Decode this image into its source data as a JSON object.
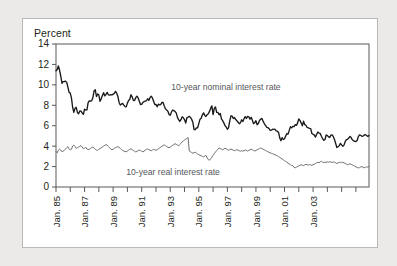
{
  "figure": {
    "background_color": "#eceae8",
    "card_color": "#ffffff",
    "border_color": "#b9b9b9"
  },
  "chart_data": {
    "type": "line",
    "title": "",
    "subtitle": "",
    "ylabel": "Percent",
    "xlabel": "",
    "ylim": [
      0,
      14
    ],
    "ytick_values": [
      0,
      2,
      4,
      6,
      8,
      10,
      12,
      14
    ],
    "ytick_labels": [
      "0",
      "2",
      "4",
      "6",
      "8",
      "10",
      "12",
      "14"
    ],
    "xlim": [
      "Jan. 85",
      "Jul. 03"
    ],
    "xtick_labels": [
      "Jan. 85",
      "Jan. 87",
      "Jan. 89",
      "Jan. 91",
      "Jan. 93",
      "Jan. 95",
      "Jan. 97",
      "Jan. 99",
      "Jan. 01",
      "Jan. 03"
    ],
    "xtick_minor_years": [
      "1986",
      "1988",
      "1990",
      "1992",
      "1994",
      "1996",
      "1998",
      "2000",
      "2002"
    ],
    "grid": false,
    "legend_position": "inline-annotation",
    "x_start_year": 1985,
    "x_end_year": 2003.5,
    "x_step_months": 1,
    "annotations": [
      {
        "text": "10-year nominal interest rate",
        "x_year": 1996.9,
        "y_value": 9.45,
        "color": "#55585c"
      },
      {
        "text": "10-year real interest rate",
        "x_year": 1993.2,
        "y_value": 1.15,
        "color": "#55585c"
      }
    ],
    "series": [
      {
        "name": "10-year nominal interest rate",
        "color": "#1a1a1a",
        "width": 1.35,
        "values": [
          11.38,
          11.51,
          11.86,
          11.43,
          10.85,
          10.16,
          10.31,
          10.33,
          10.37,
          10.24,
          9.78,
          9.26,
          9.19,
          8.7,
          7.78,
          7.3,
          7.71,
          7.8,
          7.3,
          7.17,
          7.45,
          7.43,
          7.25,
          7.11,
          7.61,
          7.54,
          7.55,
          8.25,
          8.43,
          8.4,
          8.45,
          8.76,
          9.42,
          9.52,
          8.86,
          9.11,
          9.0,
          8.39,
          8.63,
          8.95,
          9.23,
          8.92,
          9.06,
          9.26,
          9.03,
          8.99,
          9.04,
          9.01,
          9.09,
          9.17,
          9.36,
          9.18,
          8.86,
          8.28,
          8.02,
          8.11,
          8.19,
          8.01,
          7.87,
          7.84,
          8.21,
          8.47,
          8.59,
          9.03,
          8.83,
          8.48,
          8.47,
          8.75,
          8.89,
          8.72,
          8.39,
          8.08,
          8.09,
          8.28,
          8.37,
          8.4,
          8.46,
          8.64,
          8.47,
          8.75,
          8.89,
          8.72,
          8.39,
          8.08,
          8.09,
          7.85,
          8.11,
          8.04,
          8.07,
          8.28,
          8.27,
          7.9,
          7.65,
          7.53,
          7.42,
          7.09,
          7.03,
          7.34,
          7.54,
          7.48,
          7.39,
          7.26,
          6.84,
          6.59,
          6.42,
          6.59,
          6.87,
          6.77,
          6.6,
          6.26,
          6.8,
          6.85,
          6.92,
          6.81,
          6.63,
          6.32,
          5.62,
          5.61,
          5.78,
          5.8,
          6.21,
          6.64,
          6.74,
          7.07,
          7.26,
          7.01,
          6.91,
          7.08,
          7.17,
          7.4,
          7.72,
          7.94,
          7.09,
          7.69,
          7.83,
          7.31,
          7.31,
          7.07,
          7.2,
          6.66,
          6.5,
          6.28,
          6.01,
          5.87,
          5.65,
          5.81,
          6.48,
          6.97,
          6.94,
          6.71,
          6.8,
          6.6,
          6.48,
          6.34,
          6.2,
          6.3,
          6.58,
          6.42,
          6.69,
          6.89,
          6.71,
          6.91,
          6.87,
          6.64,
          6.83,
          6.53,
          6.2,
          6.3,
          6.49,
          6.1,
          6.22,
          6.51,
          6.65,
          6.71,
          6.45,
          6.21,
          6.03,
          5.85,
          5.82,
          5.71,
          5.54,
          5.57,
          5.65,
          5.64,
          5.65,
          5.5,
          5.46,
          5.34,
          4.81,
          4.53,
          4.83,
          4.65,
          4.72,
          5.0,
          5.23,
          5.18,
          5.54,
          5.9,
          5.79,
          5.94,
          5.92,
          6.11,
          6.03,
          6.28,
          6.66,
          6.52,
          6.26,
          5.99,
          6.44,
          6.1,
          6.05,
          5.83,
          5.8,
          5.74,
          5.72,
          5.24,
          5.16,
          5.1,
          4.89,
          5.14,
          5.39,
          5.28,
          5.24,
          4.97,
          4.73,
          4.57,
          4.65,
          5.09,
          5.04,
          4.91,
          4.85,
          5.08,
          5.1,
          4.93,
          4.65,
          4.26,
          3.87,
          3.94,
          4.05,
          4.27,
          4.12,
          3.98,
          4.1,
          4.45,
          4.63,
          4.67,
          4.79,
          4.95,
          4.84,
          4.62,
          4.52,
          4.48,
          4.45,
          4.56,
          4.92,
          5.1,
          5.06,
          4.96,
          4.98,
          5.09,
          5.12,
          5.04,
          4.95,
          5.05
        ]
      },
      {
        "name": "10-year real interest rate",
        "color": "#6d6e71",
        "width": 1.0,
        "values": [
          3.48,
          3.34,
          3.6,
          3.7,
          3.62,
          3.45,
          3.52,
          3.6,
          3.7,
          3.85,
          3.95,
          3.75,
          3.62,
          3.7,
          4.02,
          4.1,
          3.96,
          3.78,
          3.84,
          3.9,
          3.98,
          4.05,
          3.92,
          3.74,
          3.8,
          3.88,
          3.72,
          3.66,
          3.7,
          3.78,
          3.86,
          3.92,
          3.8,
          3.7,
          3.62,
          3.58,
          3.7,
          3.78,
          3.84,
          3.92,
          4.0,
          4.08,
          4.14,
          4.1,
          3.98,
          3.84,
          3.72,
          3.64,
          3.7,
          3.78,
          3.85,
          3.9,
          3.96,
          3.88,
          3.78,
          3.66,
          3.58,
          3.52,
          3.48,
          3.45,
          3.52,
          3.6,
          3.68,
          3.74,
          3.66,
          3.58,
          3.5,
          3.44,
          3.48,
          3.56,
          3.62,
          3.58,
          3.5,
          3.44,
          3.52,
          3.6,
          3.68,
          3.72,
          3.66,
          3.6,
          3.55,
          3.62,
          3.7,
          3.64,
          3.58,
          3.66,
          3.74,
          3.82,
          3.9,
          3.98,
          4.06,
          4.12,
          4.05,
          3.96,
          3.9,
          3.84,
          3.92,
          4.0,
          4.08,
          4.16,
          4.24,
          4.18,
          4.1,
          4.02,
          4.16,
          4.28,
          4.4,
          4.52,
          4.6,
          4.68,
          4.76,
          4.84,
          3.52,
          3.45,
          3.38,
          3.3,
          3.36,
          3.42,
          3.3,
          3.22,
          3.18,
          3.1,
          3.05,
          3.0,
          2.95,
          3.02,
          3.1,
          2.85,
          2.68,
          2.62,
          2.78,
          2.92,
          3.1,
          3.28,
          3.42,
          3.56,
          3.7,
          3.82,
          3.76,
          3.7,
          3.64,
          3.72,
          3.8,
          3.74,
          3.66,
          3.6,
          3.66,
          3.72,
          3.66,
          3.6,
          3.55,
          3.6,
          3.66,
          3.6,
          3.55,
          3.5,
          3.56,
          3.5,
          3.56,
          3.62,
          3.58,
          3.52,
          3.58,
          3.64,
          3.7,
          3.64,
          3.58,
          3.52,
          3.58,
          3.64,
          3.7,
          3.76,
          3.82,
          3.76,
          3.7,
          3.64,
          3.58,
          3.52,
          3.46,
          3.4,
          3.34,
          3.3,
          3.26,
          3.2,
          3.16,
          3.1,
          3.04,
          2.98,
          2.9,
          2.82,
          2.74,
          2.66,
          2.58,
          2.5,
          2.42,
          2.34,
          2.26,
          2.18,
          2.12,
          2.08,
          1.92,
          1.88,
          1.94,
          2.0,
          2.06,
          2.12,
          2.18,
          2.14,
          2.1,
          2.16,
          2.22,
          2.18,
          2.14,
          2.2,
          2.16,
          2.12,
          2.18,
          2.24,
          2.3,
          2.36,
          2.42,
          2.38,
          2.46,
          2.52,
          2.44,
          2.38,
          2.44,
          2.4,
          2.46,
          2.42,
          2.48,
          2.44,
          2.4,
          2.46,
          2.42,
          2.36,
          2.3,
          2.36,
          2.42,
          2.38,
          2.44,
          2.4,
          2.36,
          2.3,
          2.24,
          2.18,
          2.22,
          2.28,
          2.22,
          2.16,
          2.1,
          2.04,
          1.98,
          1.92,
          1.86,
          1.9,
          1.96,
          2.0,
          1.94,
          1.88,
          1.92,
          1.98,
          1.94,
          2.0
        ]
      }
    ]
  }
}
